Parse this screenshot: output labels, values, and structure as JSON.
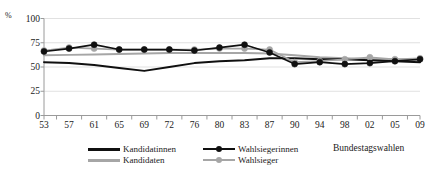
{
  "chart_data": {
    "type": "line",
    "title": "",
    "xlabel": "Bundestagswahlen",
    "ylabel": "%",
    "ylim": [
      0,
      100
    ],
    "yticks": [
      0,
      25,
      50,
      75,
      100
    ],
    "grid": true,
    "legend_position": "bottom",
    "categories": [
      "53",
      "57",
      "61",
      "65",
      "69",
      "72",
      "76",
      "80",
      "83",
      "87",
      "90",
      "94",
      "98",
      "02",
      "05",
      "09"
    ],
    "series": [
      {
        "name": "Kandidatinnen",
        "color": "#101010",
        "style": "line",
        "markers": false,
        "values": [
          55,
          54,
          52,
          49,
          46,
          50,
          54,
          56,
          57,
          59,
          59,
          58,
          58,
          57,
          56,
          55
        ]
      },
      {
        "name": "Kandidaten",
        "color": "#a6a6a6",
        "style": "line",
        "markers": false,
        "values": [
          62,
          62.5,
          63,
          63.5,
          64,
          64.5,
          64.5,
          64.5,
          64.5,
          64,
          62,
          60,
          59,
          58,
          58,
          57
        ]
      },
      {
        "name": "Wahlsiegerinnen",
        "color": "#101010",
        "style": "line-marker",
        "markers": true,
        "values": [
          66,
          69,
          73,
          68,
          68,
          68,
          67,
          70,
          73,
          65,
          53,
          55,
          53,
          54,
          56,
          58
        ]
      },
      {
        "name": "Wahlsieger",
        "color": "#a6a6a6",
        "style": "line-marker",
        "markers": true,
        "values": [
          67,
          70,
          69,
          68,
          68,
          68,
          68,
          69,
          69,
          68,
          55,
          56,
          58,
          60,
          58,
          59
        ]
      }
    ]
  },
  "legend": {
    "items": [
      {
        "label": "Kandidatinnen",
        "color": "#101010",
        "marker": false
      },
      {
        "label": "Kandidaten",
        "color": "#a6a6a6",
        "marker": false
      },
      {
        "label": "Wahlsiegerinnen",
        "color": "#101010",
        "marker": true
      },
      {
        "label": "Wahlsieger",
        "color": "#a6a6a6",
        "marker": true
      }
    ]
  }
}
